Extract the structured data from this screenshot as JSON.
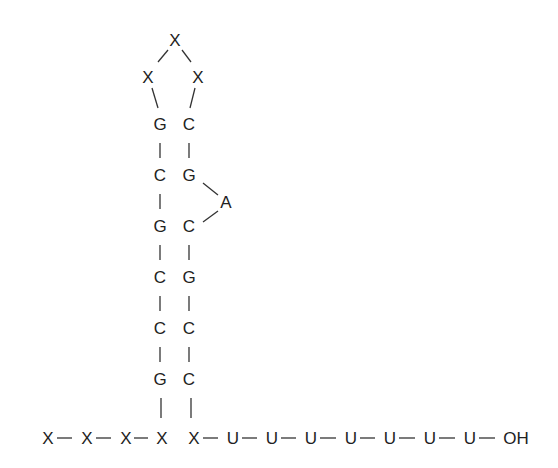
{
  "diagram": {
    "type": "rna-hairpin-terminator",
    "loop": [
      {
        "label": "X",
        "x": 175,
        "y": 40
      },
      {
        "label": "X",
        "x": 148,
        "y": 77
      },
      {
        "label": "X",
        "x": 198,
        "y": 77
      }
    ],
    "stem_left": [
      {
        "label": "G",
        "x": 160,
        "y": 124
      },
      {
        "label": "C",
        "x": 160,
        "y": 175
      },
      {
        "label": "G",
        "x": 160,
        "y": 226
      },
      {
        "label": "C",
        "x": 160,
        "y": 277
      },
      {
        "label": "C",
        "x": 160,
        "y": 328
      },
      {
        "label": "G",
        "x": 160,
        "y": 379
      }
    ],
    "stem_right": [
      {
        "label": "C",
        "x": 189,
        "y": 124
      },
      {
        "label": "G",
        "x": 189,
        "y": 175
      },
      {
        "label": "C",
        "x": 189,
        "y": 226
      },
      {
        "label": "G",
        "x": 189,
        "y": 277
      },
      {
        "label": "C",
        "x": 189,
        "y": 328
      },
      {
        "label": "C",
        "x": 189,
        "y": 379
      }
    ],
    "bulge": {
      "label": "A",
      "x": 226,
      "y": 202
    },
    "strand_5prime": [
      {
        "label": "X",
        "x": 48,
        "y": 438
      },
      {
        "label": "X",
        "x": 87,
        "y": 438
      },
      {
        "label": "X",
        "x": 126,
        "y": 438
      },
      {
        "label": "X",
        "x": 162,
        "y": 438
      }
    ],
    "strand_3prime": [
      {
        "label": "X",
        "x": 194,
        "y": 438
      },
      {
        "label": "U",
        "x": 233,
        "y": 438
      },
      {
        "label": "U",
        "x": 272,
        "y": 438
      },
      {
        "label": "U",
        "x": 311,
        "y": 438
      },
      {
        "label": "U",
        "x": 351,
        "y": 438
      },
      {
        "label": "U",
        "x": 390,
        "y": 438
      },
      {
        "label": "U",
        "x": 430,
        "y": 438
      },
      {
        "label": "U",
        "x": 470,
        "y": 438
      },
      {
        "label": "OH",
        "x": 516,
        "y": 438
      }
    ]
  }
}
